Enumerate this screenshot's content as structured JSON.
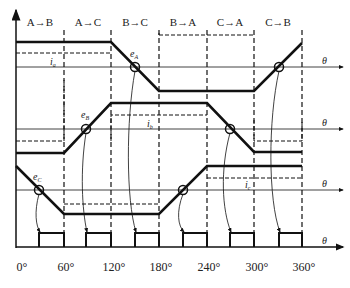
{
  "diagram": {
    "sectors": [
      "A→B",
      "A→C",
      "B→C",
      "B→A",
      "C→A",
      "C→B"
    ],
    "x_ticks": [
      "0°",
      "60°",
      "120°",
      "180°",
      "240°",
      "300°",
      "360°"
    ],
    "axis_label": "θ",
    "phases": [
      {
        "emf_label": "e",
        "emf_sub": "A",
        "current_label": "i",
        "current_sub": "a"
      },
      {
        "emf_label": "e",
        "emf_sub": "B",
        "current_label": "i",
        "current_sub": "b"
      },
      {
        "emf_label": "e",
        "emf_sub": "C",
        "current_label": "i",
        "current_sub": "c"
      }
    ],
    "colors": {
      "line": "#111111",
      "background": "#ffffff"
    }
  }
}
